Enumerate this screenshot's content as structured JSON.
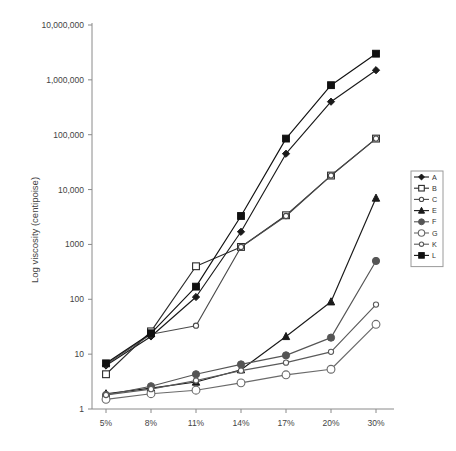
{
  "chart_data": {
    "type": "line",
    "title": "",
    "xlabel": "",
    "ylabel": "Log viscosity (centipoise)",
    "categories": [
      "5%",
      "8%",
      "11%",
      "14%",
      "17%",
      "20%",
      "30%"
    ],
    "x_tick_labels": [
      "5%",
      "8%",
      "11%",
      "14%",
      "17%",
      "20%",
      "30%"
    ],
    "y_tick_labels": [
      "1",
      "10",
      "100",
      "1000",
      "10,000",
      "100,000",
      "1,000,000",
      "10,000,000"
    ],
    "y_tick_values": [
      1,
      10,
      100,
      1000,
      10000,
      100000,
      1000000,
      10000000
    ],
    "ylim": [
      1,
      10000000
    ],
    "y_scale": "log",
    "grid": false,
    "legend_position": "right-outside",
    "legend_entries": [
      "A",
      "B",
      "C",
      "E",
      "F",
      "G",
      "K",
      "L"
    ],
    "series": [
      {
        "name": "A",
        "marker": "filled-diamond",
        "color": "#1a1a1a",
        "values": [
          6.2,
          21,
          110,
          1700,
          45000,
          400000,
          1500000
        ]
      },
      {
        "name": "B",
        "marker": "open-square",
        "color": "#2b2b2b",
        "values": [
          4.3,
          26,
          400,
          900,
          3400,
          18000,
          85000
        ]
      },
      {
        "name": "C",
        "marker": "open-circle-small",
        "color": "#4a4a4a",
        "values": [
          6.5,
          23,
          33,
          900,
          3300,
          18000,
          85000
        ]
      },
      {
        "name": "E",
        "marker": "filled-triangle",
        "color": "#1a1a1a",
        "values": [
          1.9,
          2.4,
          3.1,
          5.2,
          21,
          90,
          7000
        ]
      },
      {
        "name": "F",
        "marker": "filled-circle",
        "color": "#555555",
        "values": [
          1.8,
          2.6,
          4.3,
          6.5,
          9.5,
          20,
          500
        ]
      },
      {
        "name": "G",
        "marker": "open-circle",
        "color": "#6a6a6a",
        "values": [
          1.5,
          1.9,
          2.2,
          3.0,
          4.2,
          5.3,
          35
        ]
      },
      {
        "name": "K",
        "marker": "open-circle-small",
        "color": "#5a5a5a",
        "values": [
          1.8,
          2.3,
          3.3,
          5.0,
          7.0,
          11,
          80
        ]
      },
      {
        "name": "L",
        "marker": "filled-square",
        "color": "#111111",
        "values": [
          6.8,
          24,
          170,
          3300,
          85000,
          800000,
          3000000
        ]
      }
    ]
  },
  "axis": {
    "y_label_text": "Log viscosity (centipoise)"
  }
}
